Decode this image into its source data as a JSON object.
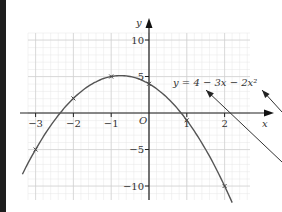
{
  "chart_data": {
    "type": "line",
    "title": "",
    "equation_label": "y = 4 − 3x − 2x²",
    "xlabel": "x",
    "ylabel": "y",
    "origin_label": "O",
    "xlim": [
      -3.3,
      3.2
    ],
    "ylim": [
      -12,
      12
    ],
    "x_ticks": [
      -3,
      -2,
      -1,
      1,
      2
    ],
    "x_tick_labels": [
      "−3",
      "−2",
      "−1",
      "1",
      "2"
    ],
    "y_ticks": [
      10,
      5,
      -5,
      -10
    ],
    "y_tick_labels": [
      "10",
      "5",
      "−5",
      "−10"
    ],
    "grid": true,
    "series": [
      {
        "name": "y = 4 − 3x − 2x²",
        "x": [
          -3,
          -2,
          -1,
          0,
          1,
          2
        ],
        "values": [
          -5,
          2,
          5,
          4,
          -1,
          -10
        ]
      }
    ],
    "annotations": [
      {
        "type": "arrow",
        "note": "line pointing to equation label, left arrow"
      },
      {
        "type": "arrow",
        "note": "line pointing to equation label, right arrow"
      }
    ],
    "colors": {
      "curve": "#555555",
      "grid": "#dcdcdc",
      "axis": "#222222",
      "left_bar": "#1e1e1e"
    }
  }
}
